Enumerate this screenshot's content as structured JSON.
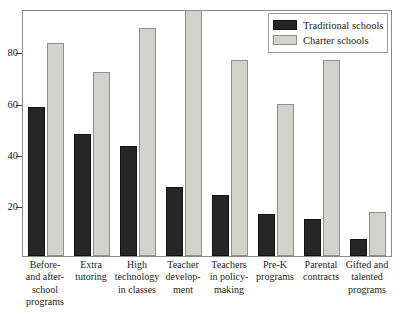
{
  "chart_data": {
    "type": "bar",
    "title": "",
    "xlabel": "",
    "ylabel": "",
    "ylim": [
      0,
      100
    ],
    "yticks": [
      20,
      40,
      60,
      80
    ],
    "grid": false,
    "legend_position": "top-right",
    "clipped_note": "Charter bar for Teacher development extends past the top of the plot frame",
    "categories": [
      "Before- and after-school programs",
      "Extra tutoring",
      "High technology in classes",
      "Teacher development",
      "Teachers in policy-making",
      "Pre-K programs",
      "Parental contracts",
      "Gifted and talented programs"
    ],
    "category_lines": [
      [
        "Before-",
        "and after-",
        "school",
        "programs"
      ],
      [
        "Extra",
        "tutoring"
      ],
      [
        "High",
        "technology",
        "in classes"
      ],
      [
        "Teacher",
        "develop-",
        "ment"
      ],
      [
        "Teachers",
        "in policy-",
        "making"
      ],
      [
        "Pre-K",
        "programs"
      ],
      [
        "Parental",
        "contracts"
      ],
      [
        "Gifted and",
        "talented",
        "programs"
      ]
    ],
    "series": [
      {
        "name": "Traditional schools",
        "color": "#262626",
        "values": [
          61,
          50,
          45,
          28,
          25,
          17,
          15,
          7
        ]
      },
      {
        "name": "Charter schools",
        "color": "#d2d2ce",
        "values": [
          87,
          75,
          93,
          105,
          80,
          62,
          80,
          18
        ]
      }
    ]
  },
  "legend": {
    "entries": [
      {
        "label": "Traditional schools",
        "swatch": "dark-swatch"
      },
      {
        "label": "Charter schools",
        "swatch": "light-swatch"
      }
    ]
  },
  "axis": {
    "y_tick_labels": [
      "80",
      "60",
      "40",
      "20"
    ]
  },
  "title_remnant": "cut-off heading"
}
